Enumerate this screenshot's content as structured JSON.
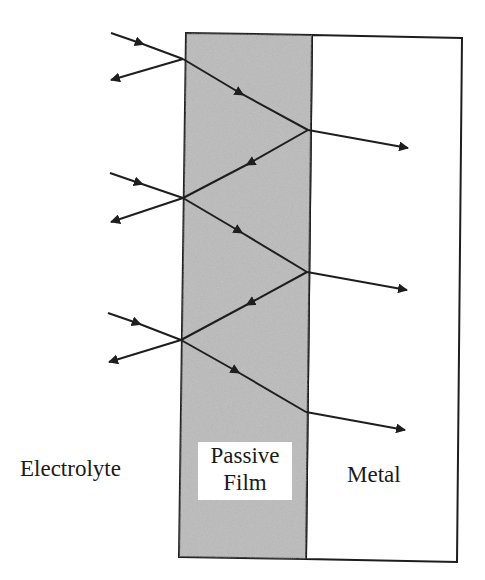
{
  "diagram": {
    "regions": {
      "electrolyte": {
        "label": "Electrolyte"
      },
      "passive_film": {
        "label_line1": "Passive",
        "label_line2": "Film",
        "fill": "#b4b4b4"
      },
      "metal": {
        "label": "Metal",
        "fill": "#ffffff"
      }
    },
    "colors": {
      "stroke": "#1e1e1e",
      "film": "#b4b4b4",
      "background": "#ffffff"
    },
    "rays": [
      {
        "incident_start": [
          111,
          33
        ],
        "film_entry": [
          183,
          59
        ],
        "reflect_end": [
          111,
          80
        ],
        "film_exit": [
          308,
          130
        ],
        "transmit_end": [
          408,
          148
        ]
      },
      {
        "incident_start": [
          110,
          173
        ],
        "film_entry": [
          183,
          198
        ],
        "reflect_end": [
          111,
          222
        ],
        "film_exit": [
          307,
          272
        ],
        "transmit_end": [
          407,
          290
        ]
      },
      {
        "incident_start": [
          108,
          313
        ],
        "film_entry": [
          181,
          340
        ],
        "reflect_end": [
          109,
          362
        ],
        "film_exit": [
          306,
          412
        ],
        "transmit_end": [
          405,
          430
        ]
      }
    ]
  }
}
